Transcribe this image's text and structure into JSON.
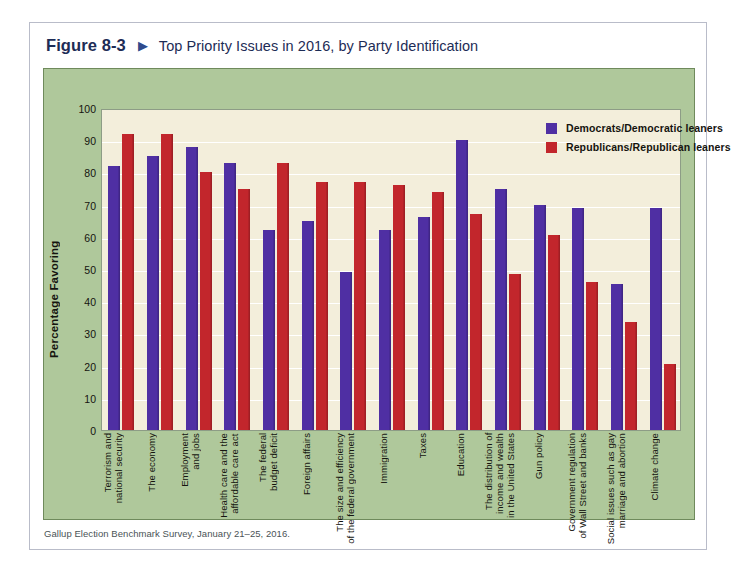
{
  "header": {
    "figure_number": "Figure 8-3",
    "arrow_icon": "triangle-right-icon",
    "title": "Top Priority Issues in 2016, by Party Identification"
  },
  "source_note": "Gallup Election Benchmark Survey, January 21–25, 2016.",
  "legend": [
    {
      "label": "Democrats/Democratic leaners",
      "color": "#4f2fa3"
    },
    {
      "label": "Republicans/Republican leaners",
      "color": "#c2262c"
    }
  ],
  "chart_data": {
    "type": "bar",
    "title": "Top Priority Issues in 2016, by Party Identification",
    "xlabel": "",
    "ylabel": "Percentage Favoring",
    "ylim": [
      0,
      100
    ],
    "yticks": [
      0,
      10,
      20,
      30,
      40,
      50,
      60,
      70,
      80,
      90,
      100
    ],
    "grid": true,
    "legend_position": "top-right",
    "plot_background": "#f3eedb",
    "panel_background": "#afc89b",
    "categories": [
      "Terrorism and\nnational security",
      "The economy",
      "Employment\nand jobs",
      "Health care and the\naffordable care act",
      "The federal\nbudget deficit",
      "Foreign affairs",
      "The size and efficiency\nof the federal government",
      "Immigration",
      "Taxes",
      "Education",
      "The distribution of\nincome and wealth\nin the United States",
      "Gun policy",
      "Government regulation\nof Wall Street and banks",
      "Social issues such as gay\nmarriage and abortion",
      "Climate change"
    ],
    "series": [
      {
        "name": "Democrats/Democratic leaners",
        "color": "#4f2fa3",
        "values": [
          82,
          85,
          88,
          83,
          62,
          65,
          49,
          62,
          66,
          90,
          75,
          70,
          69,
          45.5,
          69
        ]
      },
      {
        "name": "Republicans/Republican leaners",
        "color": "#c2262c",
        "values": [
          92,
          92,
          80,
          75,
          83,
          77,
          77,
          76,
          74,
          67,
          48.5,
          60.5,
          46,
          33.5,
          20.5
        ]
      }
    ]
  }
}
